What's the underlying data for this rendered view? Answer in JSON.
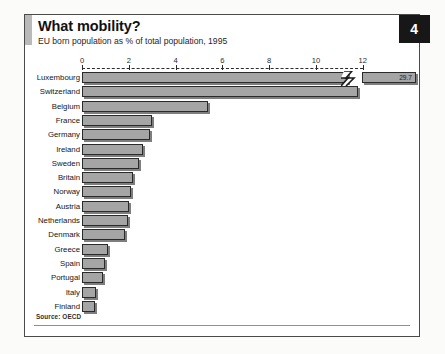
{
  "header": {
    "title": "What mobility?",
    "subtitle": "EU born population as % of total population, 1995",
    "page_number": "4"
  },
  "footer": {
    "source": "Source: OECD"
  },
  "colors": {
    "bar_fill": "#a5a5a5",
    "bar_outline": "#2a2a2a",
    "badge_bg": "#171717",
    "accent": "#b9b9b9"
  },
  "chart_data": {
    "type": "bar",
    "orientation": "horizontal",
    "title": "What mobility?",
    "subtitle": "EU born population as % of total population, 1995",
    "xlabel": "",
    "ylabel": "",
    "xlim": [
      0,
      13.2
    ],
    "grid": false,
    "legend": null,
    "axis_break": {
      "present": true,
      "at_value": 12.5,
      "note": "Luxembourg bar is broken; true value shown as data label"
    },
    "ticks": [
      {
        "value": 0,
        "label": "0"
      },
      {
        "value": 2,
        "label": "2"
      },
      {
        "value": 4,
        "label": "4"
      },
      {
        "value": 6,
        "label": "6"
      },
      {
        "value": 8,
        "label": "8"
      },
      {
        "value": 10,
        "label": "10"
      },
      {
        "value": 12,
        "label": "12"
      }
    ],
    "categories": [
      "Luxembourg",
      "Switzerland",
      "Belgium",
      "France",
      "Germany",
      "Ireland",
      "Sweden",
      "Britain",
      "Norway",
      "Austria",
      "Netherlands",
      "Denmark",
      "Greece",
      "Spain",
      "Portugal",
      "Italy",
      "Finland"
    ],
    "values": [
      29.7,
      11.8,
      5.4,
      3.0,
      2.9,
      2.6,
      2.45,
      2.2,
      2.1,
      2.0,
      1.95,
      1.85,
      1.1,
      1.0,
      0.9,
      0.6,
      0.55
    ],
    "data_labels": [
      "29.7",
      "",
      "",
      "",
      "",
      "",
      "",
      "",
      "",
      "",
      "",
      "",
      "",
      "",
      "",
      "",
      ""
    ]
  }
}
